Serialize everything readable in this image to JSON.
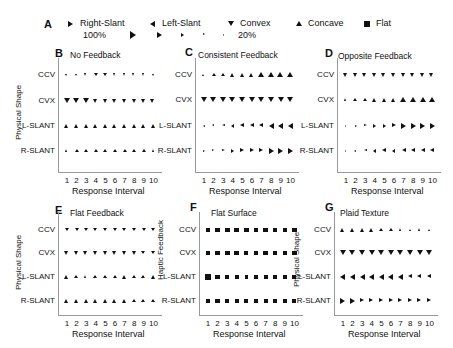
{
  "legend": {
    "letter": "A",
    "shapes": [
      {
        "name": "Right-Slant",
        "glyph": "right"
      },
      {
        "name": "Left-Slant",
        "glyph": "left"
      },
      {
        "name": "Convex",
        "glyph": "down"
      },
      {
        "name": "Concave",
        "glyph": "up"
      },
      {
        "name": "Flat",
        "glyph": "square"
      }
    ],
    "size_scale": {
      "max_label": "100%",
      "min_label": "20%",
      "steps": [
        1.0,
        0.8,
        0.6,
        0.4,
        0.2
      ]
    }
  },
  "chart_data": [
    {
      "type": "scatter",
      "panel": "B",
      "title": "No Feedback",
      "ylabel": "Physical Shape",
      "xlabel": "Response Interval",
      "x": [
        1,
        2,
        3,
        4,
        5,
        6,
        7,
        8,
        9,
        10
      ],
      "rows": [
        {
          "label": "CCV",
          "glyph": "down",
          "sizes": [
            0.4,
            0.4,
            0.45,
            0.5,
            0.5,
            0.45,
            0.45,
            0.45,
            0.45,
            0.4
          ]
        },
        {
          "label": "CVX",
          "glyph": "down",
          "sizes": [
            0.8,
            0.85,
            0.75,
            0.7,
            0.65,
            0.65,
            0.65,
            0.6,
            0.6,
            0.7
          ]
        },
        {
          "label": "L-SLANT",
          "glyph": "up",
          "sizes": [
            0.6,
            0.6,
            0.6,
            0.6,
            0.6,
            0.6,
            0.6,
            0.6,
            0.6,
            0.6
          ]
        },
        {
          "label": "R-SLANT",
          "glyph": "up",
          "sizes": [
            0.45,
            0.5,
            0.5,
            0.5,
            0.5,
            0.5,
            0.5,
            0.5,
            0.5,
            0.45
          ]
        }
      ]
    },
    {
      "type": "scatter",
      "panel": "C",
      "title": "Consistent Feedback",
      "ylabel": "",
      "xlabel": "Response Interval",
      "x": [
        1,
        2,
        3,
        4,
        5,
        6,
        7,
        8,
        9,
        10
      ],
      "rows": [
        {
          "label": "CCV",
          "glyph": "up",
          "sizes": [
            0.4,
            0.5,
            0.55,
            0.6,
            0.65,
            0.7,
            0.75,
            0.75,
            0.8,
            0.8
          ]
        },
        {
          "label": "CVX",
          "glyph": "down",
          "sizes": [
            0.8,
            0.8,
            0.8,
            0.8,
            0.75,
            0.75,
            0.75,
            0.75,
            0.75,
            0.8
          ]
        },
        {
          "label": "L-SLANT",
          "glyph": "left",
          "sizes": [
            0.3,
            0.4,
            0.45,
            0.55,
            0.6,
            0.65,
            0.7,
            0.75,
            0.8,
            0.8
          ]
        },
        {
          "label": "R-SLANT",
          "glyph": "right",
          "sizes": [
            0.3,
            0.4,
            0.45,
            0.55,
            0.6,
            0.65,
            0.7,
            0.75,
            0.8,
            0.8
          ]
        }
      ]
    },
    {
      "type": "scatter",
      "panel": "D",
      "title": "Opposite Feedback",
      "ylabel": "",
      "xlabel": "Response Interval",
      "x": [
        1,
        2,
        3,
        4,
        5,
        6,
        7,
        8,
        9,
        10
      ],
      "rows": [
        {
          "label": "CCV",
          "glyph": "down",
          "sizes": [
            0.7,
            0.7,
            0.7,
            0.7,
            0.7,
            0.7,
            0.7,
            0.7,
            0.7,
            0.7
          ]
        },
        {
          "label": "CVX",
          "glyph": "up",
          "sizes": [
            0.45,
            0.55,
            0.55,
            0.6,
            0.65,
            0.7,
            0.75,
            0.8,
            0.75,
            0.8
          ]
        },
        {
          "label": "L-SLANT",
          "glyph": "right",
          "sizes": [
            0.25,
            0.3,
            0.45,
            0.55,
            0.55,
            0.7,
            0.75,
            0.75,
            0.75,
            0.8
          ]
        },
        {
          "label": "R-SLANT",
          "glyph": "left",
          "sizes": [
            0.2,
            0.35,
            0.45,
            0.55,
            0.6,
            0.55,
            0.6,
            0.6,
            0.6,
            0.65
          ]
        }
      ]
    },
    {
      "type": "scatter",
      "panel": "E",
      "title": "Flat Feedback",
      "ylabel": "Physical Shape",
      "xlabel": "Response Interval",
      "x": [
        1,
        2,
        3,
        4,
        5,
        6,
        7,
        8,
        9,
        10
      ],
      "rows": [
        {
          "label": "CCV",
          "glyph": "down",
          "sizes": [
            0.55,
            0.5,
            0.5,
            0.55,
            0.55,
            0.55,
            0.55,
            0.55,
            0.5,
            0.5
          ]
        },
        {
          "label": "CVX",
          "glyph": "down",
          "sizes": [
            0.65,
            0.6,
            0.65,
            0.65,
            0.65,
            0.6,
            0.6,
            0.6,
            0.55,
            0.5
          ]
        },
        {
          "label": "L-SLANT",
          "glyph": "up",
          "sizes": [
            0.6,
            0.55,
            0.45,
            0.55,
            0.55,
            0.55,
            0.6,
            0.55,
            0.55,
            0.6
          ]
        },
        {
          "label": "R-SLANT",
          "glyph": "up",
          "sizes": [
            0.6,
            0.6,
            0.6,
            0.65,
            0.65,
            0.6,
            0.6,
            0.55,
            0.55,
            0.5
          ]
        }
      ]
    },
    {
      "type": "scatter",
      "panel": "F",
      "title": "Flat Surface",
      "ylabel": "Haptic Feedback",
      "xlabel": "Response Interval",
      "x": [
        1,
        2,
        3,
        4,
        5,
        6,
        7,
        8,
        9,
        10
      ],
      "rows": [
        {
          "label": "CCV",
          "glyph": "square",
          "sizes": [
            0.7,
            0.7,
            0.7,
            0.7,
            0.7,
            0.7,
            0.7,
            0.65,
            0.55,
            0.65
          ]
        },
        {
          "label": "CVX",
          "glyph": "square",
          "sizes": [
            0.55,
            0.65,
            0.7,
            0.7,
            0.6,
            0.6,
            0.65,
            0.65,
            0.65,
            0.7
          ]
        },
        {
          "label": "L-SLANT",
          "glyph": "square",
          "sizes": [
            0.8,
            0.7,
            0.6,
            0.55,
            0.55,
            0.55,
            0.6,
            0.6,
            0.6,
            0.6
          ]
        },
        {
          "label": "R-SLANT",
          "glyph": "square",
          "sizes": [
            0.65,
            0.65,
            0.6,
            0.6,
            0.6,
            0.6,
            0.6,
            0.6,
            0.6,
            0.6
          ]
        }
      ]
    },
    {
      "type": "scatter",
      "panel": "G",
      "title": "Plaid Texture",
      "ylabel": "Physical Shape",
      "xlabel": "Response Interval",
      "x": [
        1,
        2,
        3,
        4,
        5,
        6,
        7,
        8,
        9,
        10
      ],
      "rows": [
        {
          "label": "CCV",
          "glyph": "up",
          "sizes": [
            0.6,
            0.6,
            0.6,
            0.6,
            0.55,
            0.5,
            0.45,
            0.4,
            0.45,
            0.4
          ]
        },
        {
          "label": "CVX",
          "glyph": "down",
          "sizes": [
            0.75,
            0.75,
            0.75,
            0.75,
            0.75,
            0.75,
            0.75,
            0.75,
            0.75,
            0.75
          ]
        },
        {
          "label": "L-SLANT",
          "glyph": "left",
          "sizes": [
            0.75,
            0.75,
            0.75,
            0.75,
            0.75,
            0.75,
            0.75,
            0.7,
            0.7,
            0.7
          ]
        },
        {
          "label": "R-SLANT",
          "glyph": "right",
          "sizes": [
            0.75,
            0.75,
            0.7,
            0.7,
            0.7,
            0.7,
            0.7,
            0.7,
            0.7,
            0.7
          ]
        }
      ]
    }
  ]
}
